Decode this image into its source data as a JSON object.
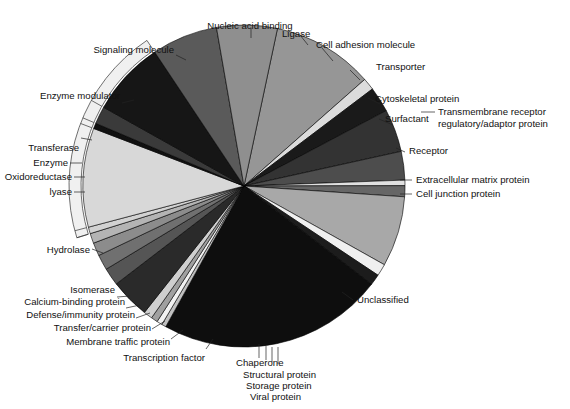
{
  "chart_data": {
    "type": "pie",
    "title": "",
    "subtitle": "",
    "xlabel": "",
    "ylabel": "",
    "legend_position": "none",
    "grid": false,
    "units": "percent of proteins",
    "note": "Protein class distribution pie chart; slices ordered clockwise starting near 12 o'clock. An outer bracket arc on the left groups the enzyme sub-classes under the single label 'Enzyme'.",
    "start_angle_deg": -78,
    "categories": [
      "Nucleic acid binding",
      "Ligase",
      "Cell adhesion molecule",
      "Transporter",
      "Cytoskeletal protein",
      "Surfactant",
      "Transmembrane receptor regulatory/adaptor protein",
      "Receptor",
      "Extracellular matrix protein",
      "Cell junction protein",
      "Unclassified",
      "Viral protein",
      "Storage protein",
      "Structural protein",
      "Chaperone",
      "Transcription factor",
      "Membrane traffic protein",
      "Transfer/carrier protein",
      "Defense/immunity protein",
      "Calcium-binding protein",
      "Isomerase",
      "Hydrolase",
      "lyase",
      "Oxidoreductase",
      "Transferase",
      "Enzyme modulator",
      "Signaling molecule"
    ],
    "values": [
      9.2,
      1.1,
      2.3,
      3.9,
      2.6,
      0.5,
      1.0,
      6.4,
      1.1,
      1.0,
      20.5,
      0.4,
      0.5,
      0.6,
      0.8,
      3.6,
      1.6,
      1.4,
      1.2,
      0.9,
      0.6,
      9.0,
      0.5,
      1.6,
      6.8,
      6.0,
      5.5
    ],
    "colors": [
      "#969696",
      "#dcdcdc",
      "#1a1a1a",
      "#333333",
      "#4d4d4d",
      "#e0e0e0",
      "#666666",
      "#a8a8a8",
      "#efefef",
      "#1c1c1c",
      "#0e0e0e",
      "#c0c0c0",
      "#f2f2f2",
      "#a0a0a0",
      "#cfcfcf",
      "#2a2a2a",
      "#555555",
      "#707070",
      "#8c8c8c",
      "#b4b4b4",
      "#d2d2d2",
      "#d8d8d8",
      "#111111",
      "#3a3a3a",
      "#161616",
      "#5a5a5a",
      "#8f8f8f"
    ],
    "enzyme_bracket": {
      "label": "Enzyme",
      "members": [
        "Transferase",
        "Oxidoreductase",
        "lyase",
        "Hydrolase",
        "Isomerase"
      ],
      "color": "#f0f0f0"
    }
  },
  "labels": {
    "nucleic_acid_binding": "Nucleic acid binding",
    "ligase": "Ligase",
    "cell_adhesion_molecule": "Cell adhesion molecule",
    "transporter": "Transporter",
    "cytoskeletal_protein": "Cytoskeletal protein",
    "surfactant": "Surfactant",
    "transmembrane_receptor_1": "Transmembrane receptor",
    "transmembrane_receptor_2": "regulatory/adaptor protein",
    "receptor": "Receptor",
    "extracellular_matrix_protein": "Extracellular matrix protein",
    "cell_junction_protein": "Cell junction protein",
    "unclassified": "Unclassified",
    "chaperone": "Chaperone",
    "structural_protein": "Structural protein",
    "storage_protein": "Storage protein",
    "viral_protein": "Viral protein",
    "transcription_factor": "Transcription factor",
    "membrane_traffic_protein": "Membrane traffic protein",
    "transfer_carrier_protein": "Transfer/carrier protein",
    "defense_immunity_protein": "Defense/immunity protein",
    "calcium_binding_protein": "Calcium-binding protein",
    "isomerase": "Isomerase",
    "hydrolase": "Hydrolase",
    "lyase": "lyase",
    "oxidoreductase": "Oxidoreductase",
    "enzyme": "Enzyme",
    "transferase": "Transferase",
    "enzyme_modulator": "Enzyme modulator",
    "signaling_molecule": "Signaling molecule"
  }
}
